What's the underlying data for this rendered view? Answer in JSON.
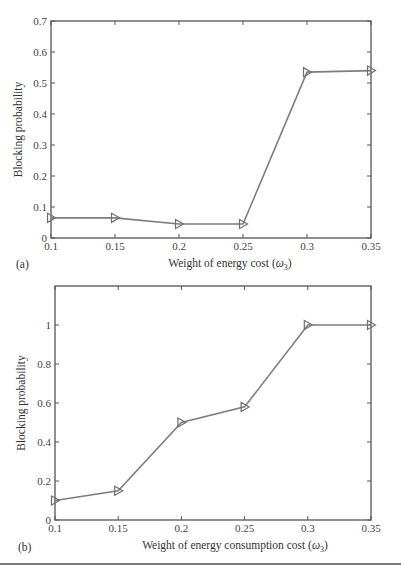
{
  "colors": {
    "axis": "#555555",
    "line": "#7d7d7d",
    "marker": "#6f6f6f",
    "text": "#333333"
  },
  "chart_data": [
    {
      "panel": "(a)",
      "type": "line",
      "title": "",
      "xlabel": "Weight of energy cost (ω3)",
      "xlabel_main": "Weight of energy cost (",
      "xlabel_symbol": "ω",
      "xlabel_sub": "3",
      "xlabel_tail": ")",
      "ylabel": "Blocking probability",
      "x": [
        0.1,
        0.15,
        0.2,
        0.25,
        0.3,
        0.35
      ],
      "series": [
        {
          "name": "Blocking probability",
          "marker": "triangle-right",
          "values": [
            0.065,
            0.065,
            0.045,
            0.045,
            0.535,
            0.54
          ]
        }
      ],
      "xlim": [
        0.1,
        0.35
      ],
      "ylim": [
        0,
        0.7
      ],
      "xticks": [
        "0.1",
        "0.15",
        "0.2",
        "0.25",
        "0.3",
        "0.35"
      ],
      "yticks": [
        "0",
        "0.1",
        "0.2",
        "0.3",
        "0.4",
        "0.5",
        "0.6",
        "0.7"
      ],
      "ytick_values": [
        0,
        0.1,
        0.2,
        0.3,
        0.4,
        0.5,
        0.6,
        0.7
      ],
      "grid": false,
      "legend": null
    },
    {
      "panel": "(b)",
      "type": "line",
      "title": "",
      "xlabel": "Weight of energy consumption cost (ω3)",
      "xlabel_main": "Weight of energy consumption cost (",
      "xlabel_symbol": "ω",
      "xlabel_sub": "3",
      "xlabel_tail": ")",
      "ylabel": "Blocking probability",
      "x": [
        0.1,
        0.15,
        0.2,
        0.25,
        0.3,
        0.35
      ],
      "series": [
        {
          "name": "Blocking probability",
          "marker": "triangle-right",
          "values": [
            0.1,
            0.15,
            0.5,
            0.58,
            1.0,
            1.0
          ]
        }
      ],
      "xlim": [
        0.1,
        0.35
      ],
      "ylim": [
        0,
        1.2
      ],
      "xticks": [
        "0.1",
        "0.15",
        "0.2",
        "0.25",
        "0.3",
        "0.35"
      ],
      "yticks": [
        "0",
        "0.2",
        "0.4",
        "0.6",
        "0.8",
        "1"
      ],
      "ytick_values": [
        0,
        0.2,
        0.4,
        0.6,
        0.8,
        1.0
      ],
      "grid": false,
      "legend": null
    }
  ],
  "layout": [
    {
      "left": 51,
      "top": 21,
      "right": 371,
      "bottom": 238,
      "panel_label_x": 16,
      "panel_label_y": 268,
      "xlabel_cx": 230,
      "xlabel_y": 267,
      "ylabel_x": 22
    },
    {
      "left": 55,
      "top": 286,
      "right": 371,
      "bottom": 520,
      "panel_label_x": 18,
      "panel_label_y": 551,
      "xlabel_cx": 235,
      "xlabel_y": 549,
      "ylabel_x": 25
    }
  ]
}
